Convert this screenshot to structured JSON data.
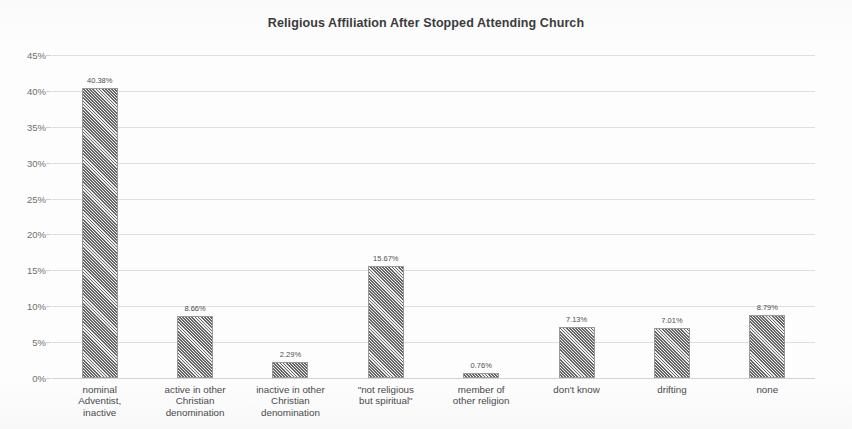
{
  "chart_data": {
    "type": "bar",
    "title": "Religious Affiliation After Stopped Attending Church",
    "xlabel": "",
    "ylabel": "",
    "ylim": [
      0,
      45
    ],
    "grid": true,
    "legend": "none",
    "ytick_labels": [
      "0%",
      "5%",
      "10%",
      "15%",
      "20%",
      "25%",
      "30%",
      "35%",
      "40%",
      "45%"
    ],
    "ytick_values": [
      0,
      5,
      10,
      15,
      20,
      25,
      30,
      35,
      40,
      45
    ],
    "categories": [
      "nominal Adventist, inactive",
      "active in other Christian denomination",
      "inactive in other Christian denomination",
      "\"not religious but spiritual\"",
      "member of other religion",
      "don't know",
      "drifting",
      "none"
    ],
    "category_lines": [
      [
        "nominal",
        "Adventist,",
        "inactive"
      ],
      [
        "active in other",
        "Christian",
        "denomination"
      ],
      [
        "inactive in other",
        "Christian",
        "denomination"
      ],
      [
        "\"not religious",
        "but spiritual\""
      ],
      [
        "member of",
        "other religion"
      ],
      [
        "don't know"
      ],
      [
        "drifting"
      ],
      [
        "none"
      ]
    ],
    "values": [
      40.38,
      8.66,
      2.29,
      15.67,
      0.76,
      7.13,
      7.01,
      8.79
    ],
    "value_labels": [
      "40.38%",
      "8.66%",
      "2.29%",
      "15.67%",
      "0.76%",
      "7.13%",
      "7.01%",
      "8.79%"
    ],
    "bar_fill": "#8d8d8d",
    "gridline_color": "#dedede",
    "text_color": "#4a4a4a"
  }
}
